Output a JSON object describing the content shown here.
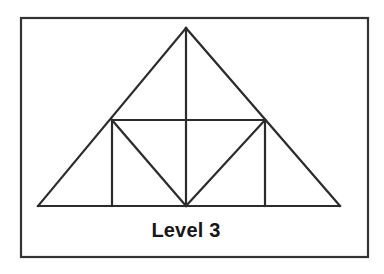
{
  "figure": {
    "caption": "Level 3",
    "background_color": "#ffffff",
    "line_color": "#2b2b2b",
    "border_color": "#333333",
    "text_color": "#171717",
    "border": {
      "name": "outer-rectangle-border",
      "x": 21,
      "y": 18,
      "width": 347,
      "height": 239,
      "stroke_width": 2.2
    },
    "diagram": {
      "type": "sierpinski-triangle",
      "level": 3,
      "description": "Large triangle subdivided with a horizontal midline, a central vertical, two side verticals and two inner diagonals forming an inverted middle triangle.",
      "stroke_width": 2.2,
      "vertices": {
        "apex": {
          "name": "apex-vertex",
          "x": 186,
          "y": 28
        },
        "base_left": {
          "name": "base-left-vertex",
          "x": 38,
          "y": 206
        },
        "base_right": {
          "name": "base-right-vertex",
          "x": 340,
          "y": 206
        },
        "mid_left": {
          "name": "mid-left-vertex",
          "x": 112,
          "y": 120
        },
        "mid_right": {
          "name": "mid-right-vertex",
          "x": 265,
          "y": 120
        },
        "base_center": {
          "name": "base-center-vertex",
          "x": 186,
          "y": 206
        }
      },
      "outline_points": "186,28 340,206 38,206",
      "segments": [
        {
          "name": "left-outer-edge",
          "x1": 186,
          "y1": 28,
          "x2": 38,
          "y2": 206
        },
        {
          "name": "right-outer-edge",
          "x1": 186,
          "y1": 28,
          "x2": 340,
          "y2": 206
        },
        {
          "name": "base-edge",
          "x1": 38,
          "y1": 206,
          "x2": 340,
          "y2": 206
        },
        {
          "name": "horizontal-midline",
          "x1": 112,
          "y1": 120,
          "x2": 265,
          "y2": 120
        },
        {
          "name": "central-vertical-line",
          "x1": 186,
          "y1": 28,
          "x2": 186,
          "y2": 206
        },
        {
          "name": "left-vertical-line",
          "x1": 112,
          "y1": 120,
          "x2": 112,
          "y2": 206
        },
        {
          "name": "right-vertical-line",
          "x1": 265,
          "y1": 120,
          "x2": 265,
          "y2": 206
        },
        {
          "name": "left-inner-diagonal",
          "x1": 112,
          "y1": 120,
          "x2": 186,
          "y2": 206
        },
        {
          "name": "right-inner-diagonal",
          "x1": 265,
          "y1": 120,
          "x2": 186,
          "y2": 206
        }
      ]
    },
    "caption_position": {
      "x": 186,
      "y": 237,
      "font_size": 20
    }
  }
}
